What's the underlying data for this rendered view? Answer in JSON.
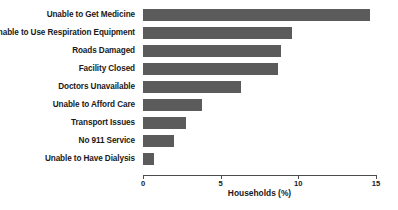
{
  "chart_data": {
    "type": "bar",
    "orientation": "horizontal",
    "title": "",
    "xlabel": "Households (%)",
    "ylabel": "",
    "xlim": [
      0,
      15
    ],
    "xticks": [
      0,
      5,
      10,
      15
    ],
    "xtick_labels": [
      "0",
      "5",
      "10",
      "15"
    ],
    "grid": false,
    "legend": null,
    "bar_color": "#5b5b5b",
    "axis_color": "#4d4d4d",
    "background_color": "#ffffff",
    "categories": [
      "Unable to Get Medicine",
      "Unable to Use Respiration Equipment",
      "Roads Damaged",
      "Facility Closed",
      "Doctors Unavailable",
      "Unable to Afford Care",
      "Transport Issues",
      "No 911 Service",
      "Unable to Have Dialysis"
    ],
    "values": [
      14.6,
      9.6,
      8.9,
      8.7,
      6.3,
      3.8,
      2.8,
      2.0,
      0.7
    ]
  }
}
